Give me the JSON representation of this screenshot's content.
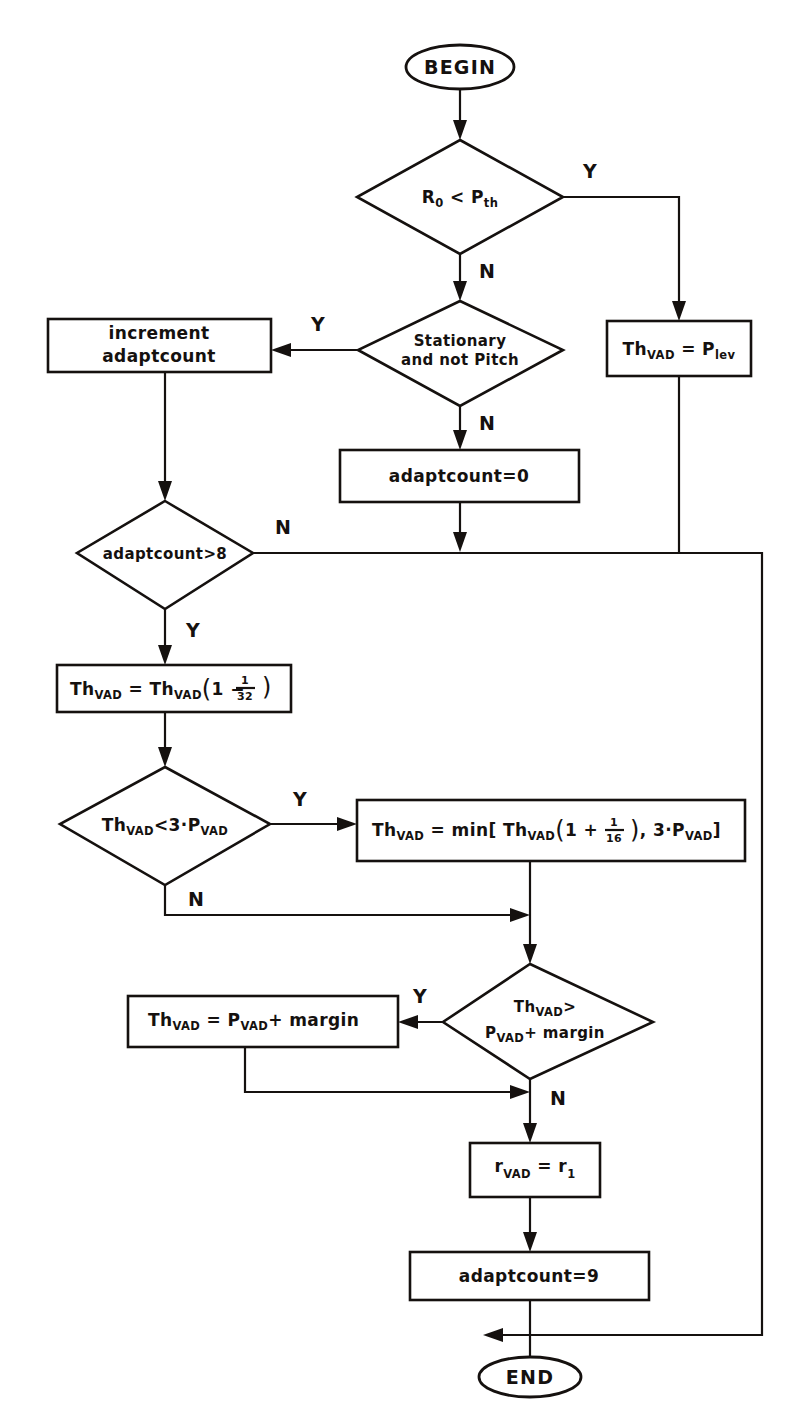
{
  "figure": {
    "type": "flowchart",
    "caption": ""
  },
  "nodes": {
    "begin": {
      "shape": "terminator",
      "label": "BEGIN"
    },
    "d_r0_pth": {
      "shape": "decision",
      "label": "R0 < Pth",
      "base": "R",
      "sub1": "0",
      "op": " < ",
      "base2": "P",
      "sub2": "th"
    },
    "p_thvad_plev": {
      "shape": "process",
      "base": "Th",
      "sub1": "VAD",
      "op": " = ",
      "base2": "P",
      "sub2": "lev"
    },
    "d_stationary": {
      "shape": "decision",
      "line1": "Stationary",
      "line2": "and not Pitch"
    },
    "p_increment": {
      "shape": "process",
      "line1": "increment",
      "line2": "adaptcount"
    },
    "p_adaptcount0": {
      "shape": "process",
      "label": "adaptcount=0"
    },
    "d_adaptcount8": {
      "shape": "decision",
      "label": "adaptcount>8"
    },
    "p_thvad_decay": {
      "shape": "process",
      "text": "Th_VAD = Th_VAD ( 1 - 1/32 )",
      "base": "Th",
      "sub": "VAD",
      "factor_num": "1",
      "factor_den": "32",
      "sign": "-"
    },
    "d_thvad_3pvad": {
      "shape": "decision",
      "text": "Th_VAD < 3 . P_VAD",
      "base": "Th",
      "sub": "VAD",
      "op": "<3·",
      "base2": "P",
      "sub2": "VAD"
    },
    "p_thvad_min": {
      "shape": "process",
      "text": "Th_VAD = min[ Th_VAD ( 1 + 1/16 ) , 3 . P_VAD ]",
      "factor_num": "1",
      "factor_den": "16",
      "sign": "+",
      "mult": "3·"
    },
    "d_thvad_margin": {
      "shape": "decision",
      "line1": "Th_VAD >",
      "line2": "P_VAD + margin"
    },
    "p_thvad_margin": {
      "shape": "process",
      "text": "Th_VAD = P_VAD + margin"
    },
    "p_rvad": {
      "shape": "process",
      "text": "r_VAD = r_1",
      "base": "r",
      "sub": "VAD",
      "base2": "r",
      "sub2": "1"
    },
    "p_adaptcount9": {
      "shape": "process",
      "label": "adaptcount=9"
    },
    "end": {
      "shape": "terminator",
      "label": "END"
    }
  },
  "branch_labels": {
    "r0_yes": "Y",
    "r0_no": "N",
    "stationary_yes": "Y",
    "stationary_no": "N",
    "adaptcount_yes": "Y",
    "adaptcount_no": "N",
    "thvad3_yes": "Y",
    "thvad3_no": "N",
    "margin_yes": "Y",
    "margin_no": "N"
  },
  "symbols": {
    "Th": "Th",
    "VAD": "VAD",
    "P": "P",
    "lev": "lev",
    "th": "th",
    "R": "R",
    "zero": "0",
    "min_open": "min[",
    "close_bracket": "]",
    "comma": ",",
    "equals": "=",
    "plus": "+",
    "minus": "−",
    "lt": "<",
    "gt": ">",
    "dot": "·",
    "margin": "margin",
    "three": "3"
  },
  "colors": {
    "ink": "#15110f",
    "paper": "#ffffff"
  }
}
